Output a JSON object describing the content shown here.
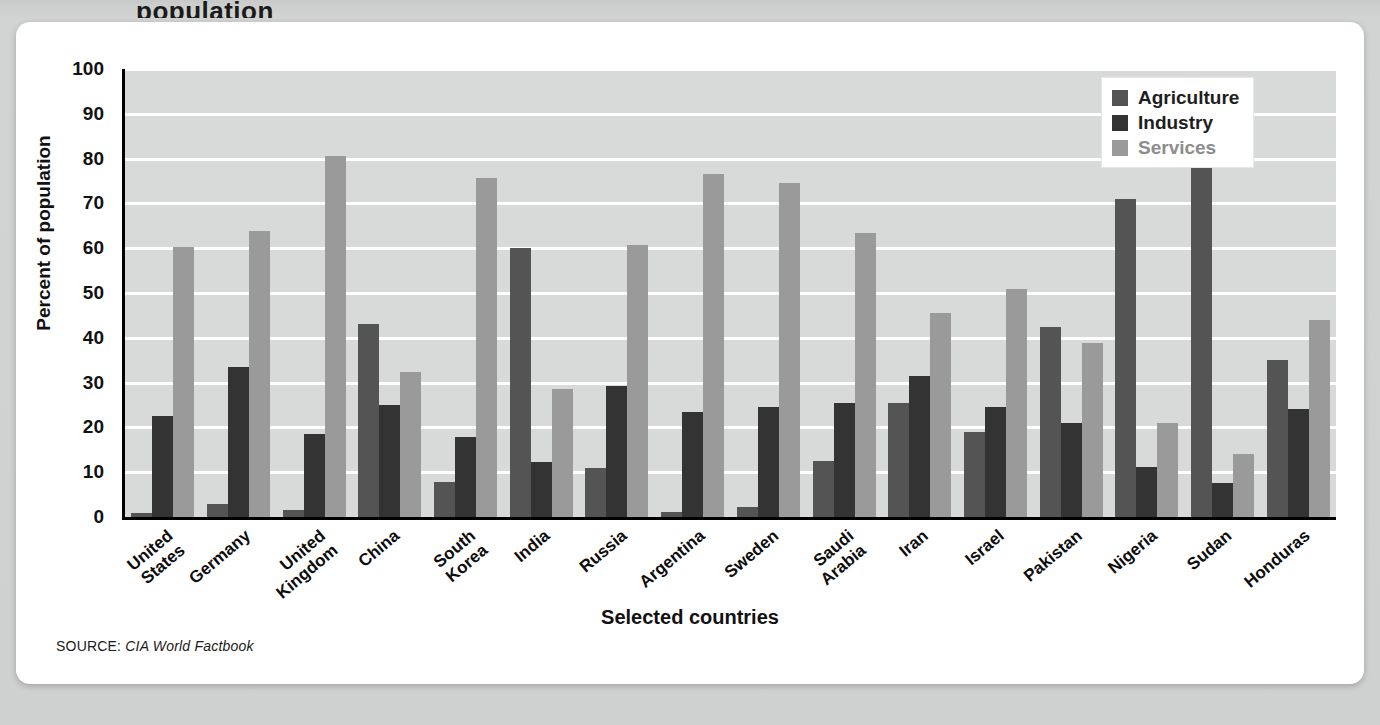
{
  "card": {
    "partial_title": "population"
  },
  "source": {
    "prefix": "SOURCE:",
    "text": "CIA World Factbook"
  },
  "legend": {
    "position": "top-right",
    "items": [
      {
        "label": "Agriculture",
        "color": "#545454"
      },
      {
        "label": "Industry",
        "color": "#333333"
      },
      {
        "label": "Services",
        "color": "#9a9a9a"
      }
    ]
  },
  "chart_data": {
    "type": "bar",
    "title": "",
    "xlabel": "Selected countries",
    "ylabel": "Percent of population",
    "ylim": [
      0,
      100
    ],
    "yticks": [
      0,
      10,
      20,
      30,
      40,
      50,
      60,
      70,
      80,
      90,
      100
    ],
    "grid": true,
    "grid_axis": "y",
    "legend_position": "top-right",
    "categories": [
      "United\nStates",
      "Germany",
      "United\nKingdom",
      "China",
      "South\nKorea",
      "India",
      "Russia",
      "Argentina",
      "Sweden",
      "Saudi\nArabia",
      "Iran",
      "Israel",
      "Pakistan",
      "Nigeria",
      "Sudan",
      "Honduras"
    ],
    "series": [
      {
        "name": "Agriculture",
        "color": "#545454",
        "values": [
          1.0,
          2.8,
          1.5,
          43.0,
          7.8,
          60.0,
          11.0,
          1.2,
          2.2,
          12.5,
          25.5,
          19.0,
          42.5,
          71.0,
          81.0,
          35.0
        ]
      },
      {
        "name": "Industry",
        "color": "#333333",
        "values": [
          22.5,
          33.5,
          18.5,
          25.0,
          17.8,
          12.3,
          29.2,
          23.5,
          24.5,
          25.5,
          31.5,
          24.5,
          21.0,
          11.2,
          7.7,
          24.0
        ]
      },
      {
        "name": "Services",
        "color": "#9a9a9a",
        "values": [
          60.3,
          63.8,
          80.6,
          32.3,
          75.6,
          28.5,
          60.8,
          76.5,
          74.5,
          63.5,
          45.6,
          51.0,
          38.8,
          21.0,
          14.0,
          44.0
        ]
      }
    ]
  }
}
